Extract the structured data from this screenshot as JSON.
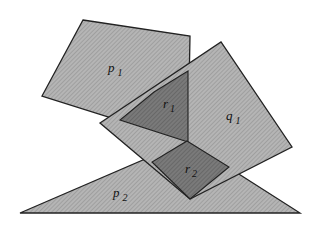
{
  "diagram": {
    "type": "polygon-overlap",
    "colors": {
      "background": "#ffffff",
      "region_fill": "#a9a9a9",
      "overlap_fill": "#6e6e6e",
      "stroke": "#222222"
    },
    "shapes": [
      {
        "id": "p1",
        "label": "p",
        "sub": "1",
        "points": "83,20 190,36 188,142 42,96",
        "label_pos": [
          108,
          72
        ]
      },
      {
        "id": "q1",
        "label": "q",
        "sub": "1",
        "points": "100,123 221,42 292,147 190,199",
        "label_pos": [
          226,
          120
        ]
      },
      {
        "id": "p2",
        "label": "p",
        "sub": "2",
        "points": "20,213 300,213 187,141",
        "label_pos": [
          113,
          197
        ]
      }
    ],
    "overlaps": [
      {
        "id": "r1",
        "label": "r",
        "sub": "1",
        "points": "154,92 188,71 188,142 120,120",
        "label_pos": [
          163,
          108
        ]
      },
      {
        "id": "r2",
        "label": "r",
        "sub": "2",
        "points": "187,141 229,167 190,199 152,162",
        "label_pos": [
          185,
          173
        ]
      }
    ]
  }
}
